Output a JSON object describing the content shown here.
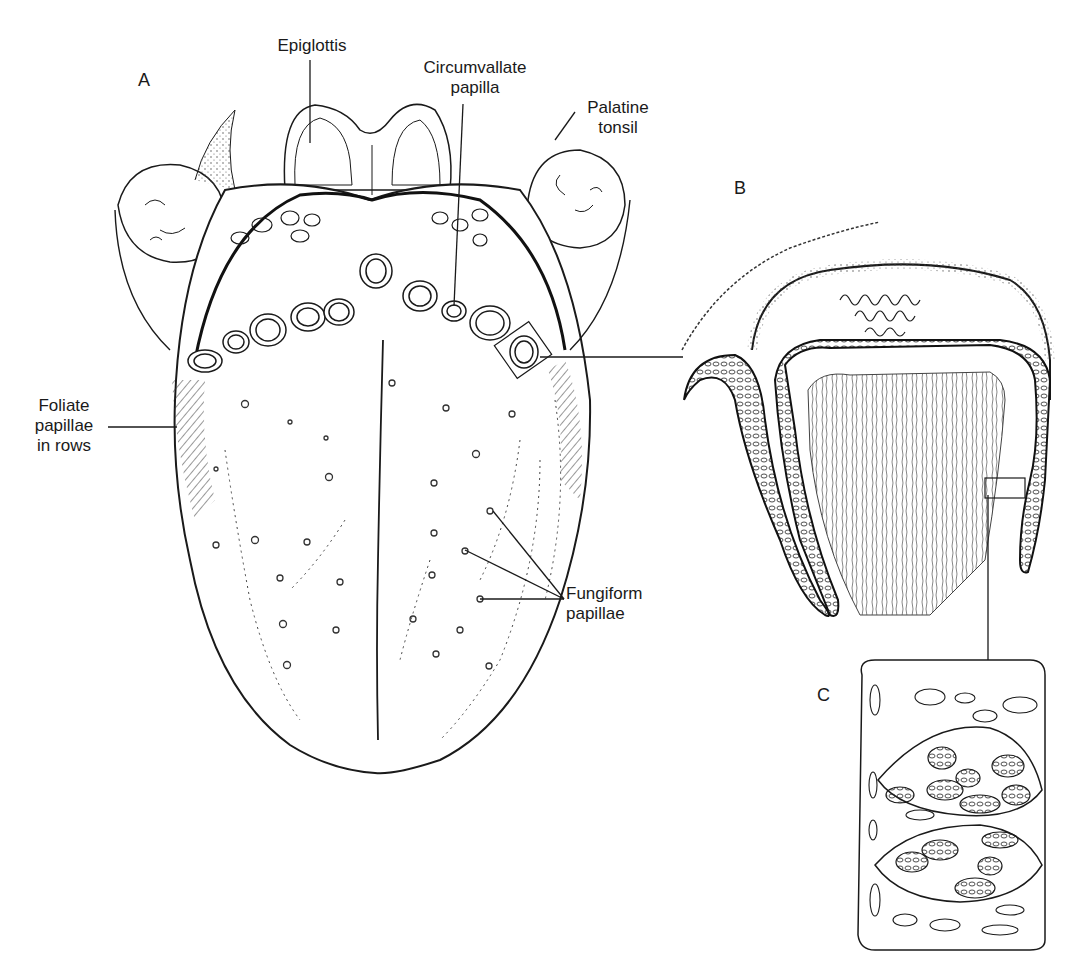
{
  "figure": {
    "panels": [
      {
        "id": "A",
        "letter": "A",
        "description": "Dorsal surface of the tongue"
      },
      {
        "id": "B",
        "letter": "B",
        "description": "Section through a circumvallate papilla"
      },
      {
        "id": "C",
        "letter": "C",
        "description": "Taste buds in the epithelium"
      }
    ],
    "labels": {
      "epiglottis": "Epiglottis",
      "circumvallate": "Circumvallate\npapilla",
      "palatine_tonsil": "Palatine\ntonsil",
      "foliate": "Foliate\npapillae\nin rows",
      "fungiform": "Fungiform\npapillae"
    },
    "colors": {
      "ink": "#1a1a1a",
      "background": "#ffffff",
      "stipple": "#555555"
    }
  }
}
